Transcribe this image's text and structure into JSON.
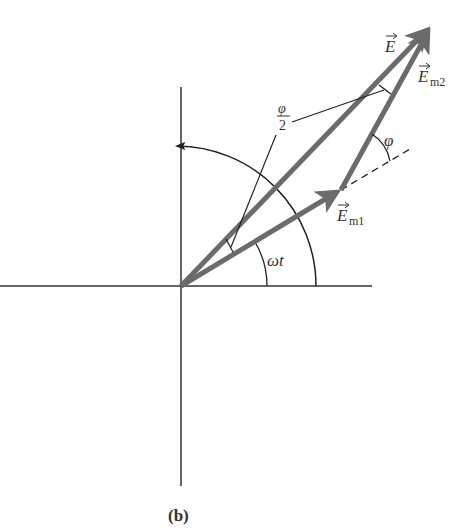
{
  "figure": {
    "caption": "(b)",
    "colors": {
      "axis": "#333333",
      "vector": "#6b6b6b",
      "thin_line": "#222222",
      "background": "#ffffff"
    },
    "origin": {
      "x": 181,
      "y": 286
    },
    "axes": {
      "horizontal": {
        "x1": 0,
        "x2": 372
      },
      "vertical": {
        "y1": 87,
        "y2": 486
      }
    },
    "vectors": [
      {
        "name": "E",
        "label": "E",
        "subscript": "",
        "from": [
          181,
          286
        ],
        "to": [
          432,
          25
        ]
      },
      {
        "name": "Em1",
        "label": "E",
        "subscript": "m1",
        "from": [
          181,
          286
        ],
        "to": [
          341,
          190
        ]
      },
      {
        "name": "Em2",
        "label": "E",
        "subscript": "m2",
        "from": [
          341,
          190
        ],
        "to": [
          432,
          25
        ]
      }
    ],
    "labels": {
      "E": "E",
      "Em1_main": "E",
      "Em1_sub": "m1",
      "Em2_main": "E",
      "Em2_sub": "m2",
      "phi": "φ",
      "half_phi_num": "φ",
      "half_phi_den": "2",
      "omega_t": "ωt"
    },
    "angles": [
      {
        "name": "omega-t",
        "label": "ωt",
        "radius": 86
      },
      {
        "name": "rotation-arc",
        "radius": 140,
        "arrow": true
      },
      {
        "name": "phi",
        "label": "φ"
      },
      {
        "name": "half-phi",
        "label": "φ/2"
      }
    ]
  }
}
